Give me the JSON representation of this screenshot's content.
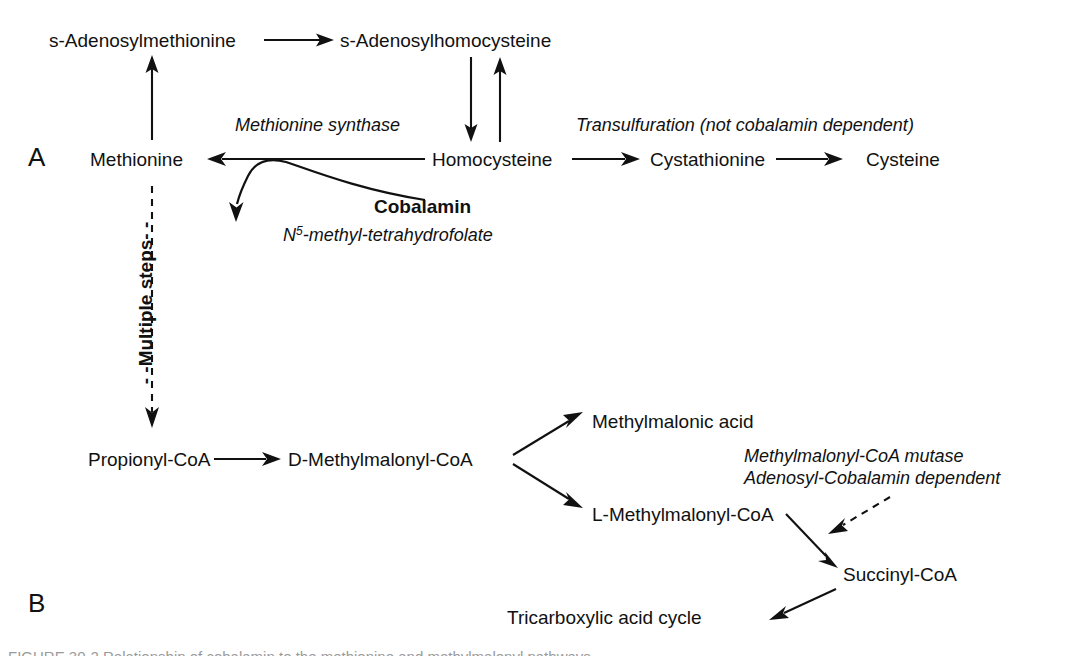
{
  "figure": {
    "panels": [
      {
        "id": "A",
        "label": "A"
      },
      {
        "id": "B",
        "label": "B"
      }
    ],
    "caption_partial": "FIGURE 30-2  Relationship of cobalamin to the methionine and methylmalonyl pathways."
  },
  "panel_a": {
    "nodes": {
      "sam": "s-Adenosylmethionine",
      "sah": "s-Adenosylhomocysteine",
      "methionine": "Methionine",
      "homocysteine": "Homocysteine",
      "cystathionine": "Cystathionine",
      "cysteine": "Cysteine"
    },
    "labels": {
      "methionine_synthase": "Methionine synthase",
      "transulfuration": "Transulfuration (not cobalamin dependent)",
      "cobalamin": "Cobalamin",
      "methyl_thf_prefix": "N",
      "methyl_thf_superscript": "5",
      "methyl_thf_suffix": "-methyl-tetrahydrofolate",
      "multiple_steps": "- -Multiple steps- -"
    }
  },
  "panel_b": {
    "nodes": {
      "propionyl_coa": "Propionyl-CoA",
      "d_methylmalonyl_coa": "D-Methylmalonyl-CoA",
      "methylmalonic_acid": "Methylmalonic acid",
      "l_methylmalonyl_coa": "L-Methylmalonyl-CoA",
      "succinyl_coa": "Succinyl-CoA",
      "tca_cycle": "Tricarboxylic acid cycle"
    },
    "labels": {
      "mutase_line1": "Methylmalonyl-CoA mutase",
      "mutase_line2": "Adenosyl-Cobalamin dependent"
    }
  },
  "colors": {
    "ink": "#111111",
    "background": "#ffffff"
  }
}
